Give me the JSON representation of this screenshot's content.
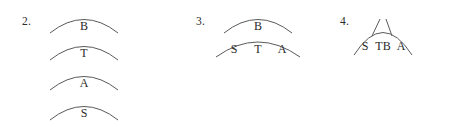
{
  "page": {
    "background_color": "#ffffff",
    "stroke_color": "#5a5a5a",
    "text_color": "#2a2a2a",
    "width": 455,
    "height": 127
  },
  "groups": [
    {
      "number": "2.",
      "name": "item-2",
      "units": [
        {
          "label": "B",
          "cells": [
            "B"
          ]
        },
        {
          "label": "T",
          "cells": [
            "T"
          ]
        },
        {
          "label": "A",
          "cells": [
            "A"
          ]
        },
        {
          "label": "S",
          "cells": [
            "S"
          ]
        }
      ]
    },
    {
      "number": "3.",
      "name": "item-3",
      "units": [
        {
          "label": "B",
          "cells": [
            "B"
          ]
        },
        {
          "label": "S T A",
          "cells": [
            "S",
            "T",
            "A"
          ]
        }
      ]
    },
    {
      "number": "4.",
      "name": "item-4",
      "units": [
        {
          "label": "S TB A",
          "cells": [
            "S",
            "TB",
            "A"
          ]
        }
      ]
    }
  ]
}
